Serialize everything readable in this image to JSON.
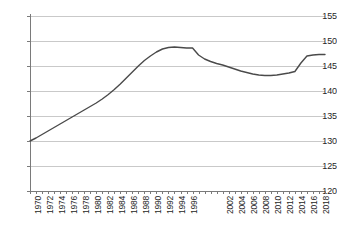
{
  "chart_data": {
    "type": "line",
    "title": "",
    "subtitle": "",
    "xlabel": "",
    "ylabel": "",
    "ylim": [
      120,
      155
    ],
    "yticks": [
      120,
      125,
      130,
      135,
      140,
      145,
      150,
      155
    ],
    "xlim": [
      1970,
      2019
    ],
    "grid": true,
    "legend": null,
    "legend_position": "none",
    "line_color": "#4a4a4a",
    "grid_color": "#c9c9c9",
    "axis_color": "#7a7a7a",
    "tick_label_color": "#262626",
    "xtick_labels": [
      "1970",
      "1972",
      "1974",
      "1976",
      "1978",
      "1980",
      "1982",
      "1984",
      "1986",
      "1988",
      "1990",
      "1992",
      "1994",
      "1996",
      "2002",
      "2004",
      "2006",
      "2008",
      "2010",
      "2012",
      "2014",
      "2016",
      "2018"
    ],
    "xtick_label_years": [
      1970,
      1972,
      1974,
      1976,
      1978,
      1980,
      1982,
      1984,
      1986,
      1988,
      1990,
      1992,
      1994,
      1996,
      2002,
      2004,
      2006,
      2008,
      2010,
      2012,
      2014,
      2016,
      2018
    ],
    "x": [
      1970,
      1971,
      1972,
      1973,
      1974,
      1975,
      1976,
      1977,
      1978,
      1979,
      1980,
      1981,
      1982,
      1983,
      1984,
      1985,
      1986,
      1987,
      1988,
      1989,
      1990,
      1991,
      1992,
      1993,
      1994,
      1995,
      1996,
      1997,
      1998,
      1999,
      2000,
      2001,
      2002,
      2003,
      2004,
      2005,
      2006,
      2007,
      2008,
      2009,
      2010,
      2011,
      2012,
      2013,
      2014,
      2015,
      2016,
      2017,
      2018,
      2019
    ],
    "values": [
      130.0,
      130.6,
      131.3,
      132.0,
      132.7,
      133.4,
      134.1,
      134.8,
      135.5,
      136.2,
      136.9,
      137.6,
      138.4,
      139.3,
      140.3,
      141.4,
      142.6,
      143.8,
      145.0,
      146.1,
      147.0,
      147.8,
      148.4,
      148.7,
      148.8,
      148.7,
      148.6,
      148.6,
      147.2,
      146.4,
      145.9,
      145.5,
      145.2,
      144.8,
      144.4,
      144.0,
      143.7,
      143.4,
      143.2,
      143.1,
      143.1,
      143.2,
      143.4,
      143.6,
      143.9,
      145.6,
      147.0,
      147.2,
      147.3,
      147.3
    ]
  }
}
